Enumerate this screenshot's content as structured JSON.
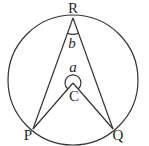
{
  "diagram": {
    "type": "circle-geometry",
    "circle": {
      "center": "C"
    },
    "points": {
      "R": {
        "label": "R"
      },
      "P": {
        "label": "P"
      },
      "Q": {
        "label": "Q"
      },
      "C": {
        "label": "C"
      }
    },
    "angles": {
      "a": {
        "label": "a",
        "vertex": "C",
        "description": "reflex angle PCQ at centre"
      },
      "b": {
        "label": "b",
        "vertex": "R",
        "description": "angle PRQ at circumference"
      }
    },
    "segments": [
      "RP",
      "RQ",
      "CP",
      "CQ"
    ]
  }
}
